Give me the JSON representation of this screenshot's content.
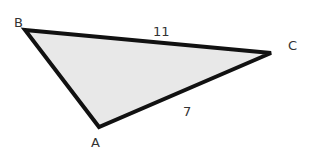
{
  "diagram": {
    "type": "triangle",
    "fill": "#e8e8e8",
    "stroke": "#111111",
    "vertices": {
      "A": {
        "label": "A",
        "x": 99,
        "y": 127
      },
      "B": {
        "label": "B",
        "x": 25,
        "y": 30
      },
      "C": {
        "label": "C",
        "x": 271,
        "y": 53
      }
    },
    "sides": {
      "BC": {
        "label": "11"
      },
      "AC": {
        "label": "7"
      }
    }
  }
}
